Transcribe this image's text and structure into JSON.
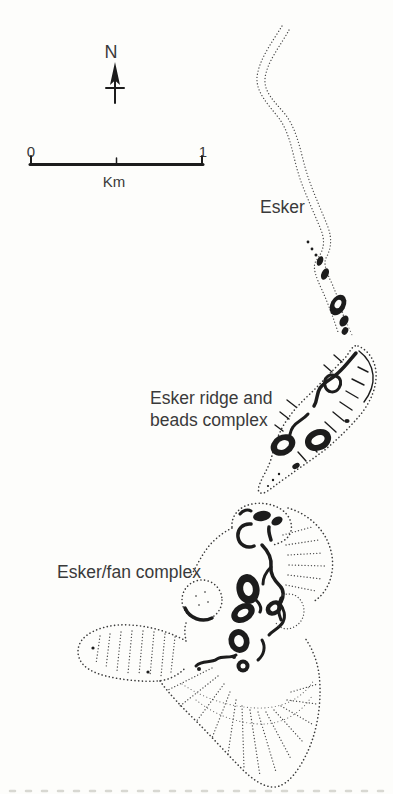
{
  "figure": {
    "background_color": "#fdfdfb",
    "ink_color": "#1c1c1c",
    "label_color": "#3a3a3a"
  },
  "compass": {
    "north_label": "N",
    "icon": "north-arrow-icon"
  },
  "scale_bar": {
    "start_label": "0",
    "end_label": "1",
    "unit_label": "Km",
    "length_km": 1
  },
  "features": {
    "esker": {
      "label": "Esker"
    },
    "ridge_beads": {
      "label_line1": "Esker ridge and",
      "label_line2": "beads complex"
    },
    "fan": {
      "label": "Esker/fan complex"
    }
  }
}
